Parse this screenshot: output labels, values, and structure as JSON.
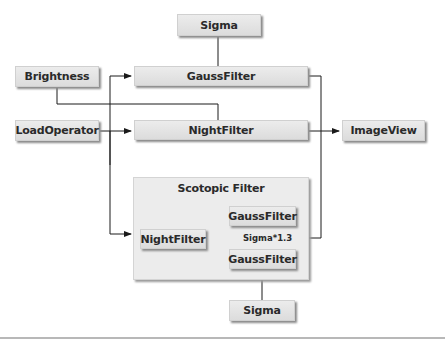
{
  "diagram": {
    "nodes": {
      "sigma_top": "Sigma",
      "brightness": "Brightness",
      "gauss_filter": "GaussFilter",
      "load_operator": "LoadOperator",
      "night_filter": "NightFilter",
      "image_view": "ImageView",
      "scotopic": {
        "title": "Scotopic Filter",
        "night_filter": "NightFilter",
        "gauss_filter_upper": "GaussFilter",
        "gauss_filter_lower": "GaussFilter",
        "sigma_scale_label": "Sigma*1.3"
      },
      "sigma_bottom": "Sigma"
    },
    "edges": [
      {
        "from": "Sigma",
        "to": "GaussFilter"
      },
      {
        "from": "Brightness",
        "to": "NightFilter"
      },
      {
        "from": "LoadOperator",
        "to": "GaussFilter"
      },
      {
        "from": "LoadOperator",
        "to": "NightFilter"
      },
      {
        "from": "LoadOperator",
        "to": "Scotopic Filter"
      },
      {
        "from": "GaussFilter",
        "to": "ImageView"
      },
      {
        "from": "NightFilter",
        "to": "ImageView"
      },
      {
        "from": "Scotopic Filter",
        "to": "ImageView"
      },
      {
        "from": "NightFilter (scotopic)",
        "to": "GaussFilter (upper)"
      },
      {
        "from": "NightFilter (scotopic)",
        "to": "GaussFilter (lower)"
      },
      {
        "from": "Sigma (bottom)",
        "to": "GaussFilter (lower)"
      },
      {
        "from": "GaussFilter (lower)",
        "to": "GaussFilter (upper)",
        "label": "Sigma*1.3"
      }
    ],
    "colors": {
      "box_fill": "#e2e2e2",
      "line": "#1a1a1a",
      "rule": "#b8b8b8"
    }
  }
}
